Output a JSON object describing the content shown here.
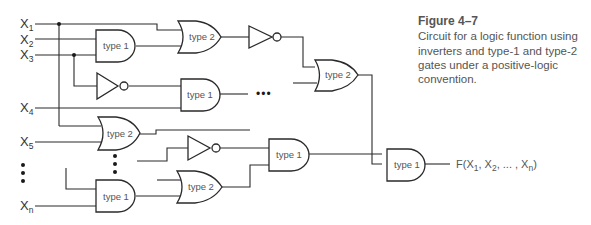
{
  "figure": {
    "title": "Figure  4–7",
    "caption": "Circuit for a logic function using inverters and type-1 and type-2 gates under a positive-logic convention."
  },
  "inputs": [
    {
      "base": "X",
      "sub": "1"
    },
    {
      "base": "X",
      "sub": "2"
    },
    {
      "base": "X",
      "sub": "3"
    },
    {
      "base": "X",
      "sub": "4"
    },
    {
      "base": "X",
      "sub": "5"
    },
    {
      "base": "X",
      "sub": "n"
    }
  ],
  "gates": {
    "g1": "type 1",
    "g2": "type 2",
    "g3": "type 1",
    "g4": "type 2",
    "g5": "type 2",
    "g6": "type 1",
    "g7": "type 1",
    "g8": "type 2",
    "g9": "type 1"
  },
  "output": {
    "prefix": "F(X",
    "s1": "1",
    "mid1": ", X",
    "s2": "2",
    "mid2": ", ... , X",
    "sn": "n",
    "suffix": ")"
  },
  "ellipsis": "•••"
}
